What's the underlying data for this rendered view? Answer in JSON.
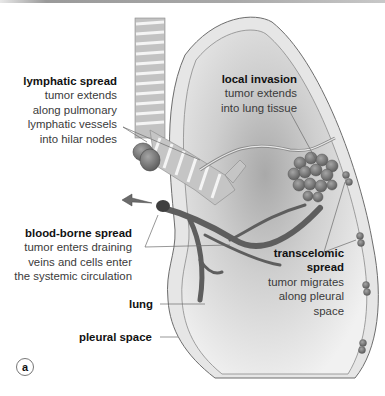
{
  "figure": {
    "panel_label": "a",
    "colors": {
      "lung_fill": "#d8d8d8",
      "pleura": "#c9c9c9",
      "tumor": "#7d7d7d",
      "vessel": "#5f5f5f",
      "trachea": "#b8b8b8"
    },
    "annotations": [
      {
        "id": "lymphatic",
        "title": "lymphatic spread",
        "lines": [
          "tumor extends",
          "along pulmonary",
          "lymphatic vessels",
          "into hilar nodes"
        ]
      },
      {
        "id": "local",
        "title": "local invasion",
        "lines": [
          "tumor extends",
          "into lung tissue"
        ]
      },
      {
        "id": "blood",
        "title": "blood-borne spread",
        "lines": [
          "tumor enters draining",
          "veins and cells enter",
          "the systemic circulation"
        ]
      },
      {
        "id": "transcelomic",
        "title_lines": [
          "transcelomic",
          "spread"
        ],
        "lines": [
          "tumor migrates",
          "along pleural",
          "space"
        ]
      }
    ],
    "structure_labels": {
      "lung": "lung",
      "pleural_space": "pleural space"
    }
  }
}
